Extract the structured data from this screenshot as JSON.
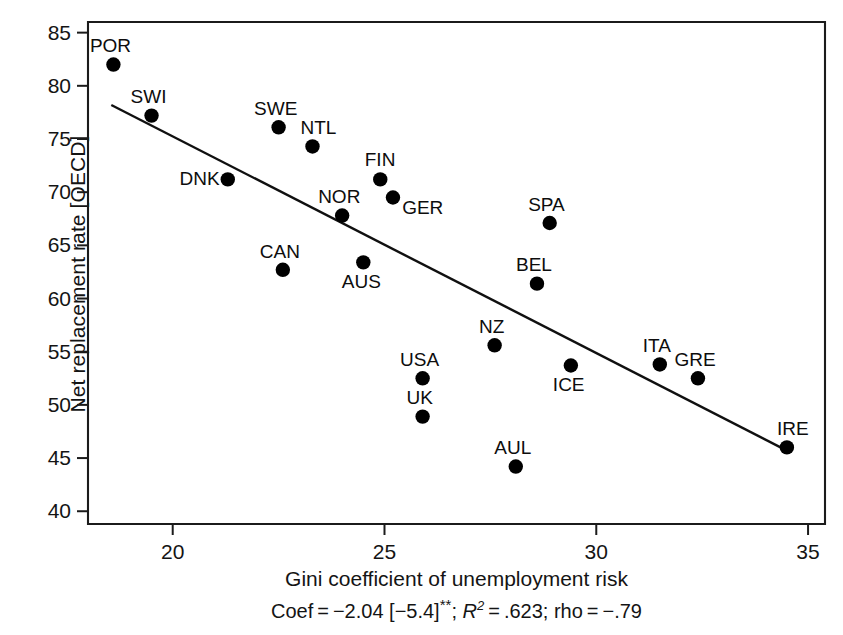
{
  "chart_data": {
    "type": "scatter",
    "title": "",
    "xlabel": "Gini coefficient of unemployment risk",
    "ylabel": "Net replacement rate [OECD]",
    "xlim": [
      18.0,
      35.4
    ],
    "ylim": [
      38.8,
      86.0
    ],
    "xticks": [
      20,
      25,
      30,
      35
    ],
    "xtick_labels": [
      "20",
      "25",
      "30",
      "35"
    ],
    "yticks": [
      40,
      45,
      50,
      55,
      60,
      65,
      70,
      75,
      80,
      85
    ],
    "ytick_labels": [
      "40",
      "45",
      "50",
      "55",
      "60",
      "65",
      "70",
      "75",
      "80",
      "85"
    ],
    "grid": false,
    "legend": "none",
    "marker": "filled-circle",
    "marker_color": "#000000",
    "points": [
      {
        "label": "POR",
        "x": 18.6,
        "y": 82.0,
        "label_pos": "above-left"
      },
      {
        "label": "SWI",
        "x": 19.5,
        "y": 77.2,
        "label_pos": "above-left"
      },
      {
        "label": "DNK",
        "x": 21.3,
        "y": 71.2,
        "label_pos": "left"
      },
      {
        "label": "SWE",
        "x": 22.5,
        "y": 76.1,
        "label_pos": "above-left"
      },
      {
        "label": "CAN",
        "x": 22.6,
        "y": 62.7,
        "label_pos": "above-left"
      },
      {
        "label": "NTL",
        "x": 23.3,
        "y": 74.3,
        "label_pos": "above-right"
      },
      {
        "label": "NOR",
        "x": 24.0,
        "y": 67.8,
        "label_pos": "above-left"
      },
      {
        "label": "AUS",
        "x": 24.5,
        "y": 63.4,
        "label_pos": "below-left"
      },
      {
        "label": "FIN",
        "x": 24.9,
        "y": 71.2,
        "label_pos": "above"
      },
      {
        "label": "GER",
        "x": 25.2,
        "y": 69.5,
        "label_pos": "below-right"
      },
      {
        "label": "USA",
        "x": 25.9,
        "y": 52.5,
        "label_pos": "above-left"
      },
      {
        "label": "UK",
        "x": 25.9,
        "y": 48.9,
        "label_pos": "above-left"
      },
      {
        "label": "NZ",
        "x": 27.6,
        "y": 55.6,
        "label_pos": "above-left"
      },
      {
        "label": "AUL",
        "x": 28.1,
        "y": 44.2,
        "label_pos": "above-left"
      },
      {
        "label": "BEL",
        "x": 28.6,
        "y": 61.4,
        "label_pos": "above-left"
      },
      {
        "label": "SPA",
        "x": 28.9,
        "y": 67.1,
        "label_pos": "above-left"
      },
      {
        "label": "ICE",
        "x": 29.4,
        "y": 53.7,
        "label_pos": "below-left"
      },
      {
        "label": "ITA",
        "x": 31.5,
        "y": 53.8,
        "label_pos": "above-left"
      },
      {
        "label": "GRE",
        "x": 32.4,
        "y": 52.5,
        "label_pos": "above-left"
      },
      {
        "label": "IRE",
        "x": 34.5,
        "y": 46.0,
        "label_pos": "above-right"
      }
    ],
    "fit_line": {
      "kind": "linear-regression",
      "x_start": 18.55,
      "y_start": 78.2,
      "x_end": 34.5,
      "y_end": 45.7,
      "slope": -2.04
    },
    "annotations": {
      "stats_note": "Coef = -2.04 [-5.4]**; R2 = .623; rho = -.79",
      "coef_prefix": "Coef",
      "coef_value": "−2.04",
      "coef_t": "[−5.4]",
      "significance": "**",
      "r2_symbol": "R",
      "r2_exponent": "2",
      "r2_value": ".623",
      "rho_label": "rho",
      "rho_value": "−.79"
    }
  }
}
